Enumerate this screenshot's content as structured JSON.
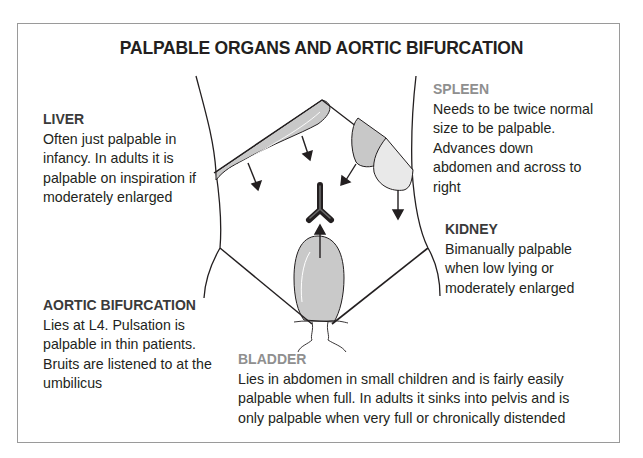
{
  "title": "PALPABLE ORGANS AND AORTIC BIFURCATION",
  "labels": {
    "liver": {
      "heading": "LIVER",
      "text": "Often just palpable in\ninfancy. In adults it is\npalpable on inspiration if\nmoderately enlarged"
    },
    "spleen": {
      "heading": "SPLEEN",
      "text": "Needs to be twice normal\nsize to be palpable.\nAdvances down\nabdomen and across to\nright"
    },
    "kidney": {
      "heading": "KIDNEY",
      "text": "Bimanually palpable\nwhen low lying or\nmoderately enlarged"
    },
    "aortic_bifurcation": {
      "heading": "AORTIC BIFURCATION",
      "text": "Lies at L4. Pulsation is\npalpable in thin patients.\nBruits are listened to at the\numbilicus"
    },
    "bladder": {
      "heading": "BLADDER",
      "text": "Lies in abdomen in small children and is fairly easily\npalpable when full. In adults it sinks into pelvis and is\nonly palpable when very full or chronically distended"
    }
  },
  "colors": {
    "outline": "#231f20",
    "organ_dark_fill": "#c8c8c8",
    "organ_light_fill": "#e6e6e6",
    "heading_grey": "#8f8f8f",
    "frame_border": "#9a9a9a"
  },
  "icons": {
    "liver_arrows": "arrow-down-icon",
    "spleen_arrows": "arrow-down-left-icon",
    "bladder_arrow": "arrow-up-icon",
    "aorta": "aortic-bifurcation-y-shape"
  }
}
